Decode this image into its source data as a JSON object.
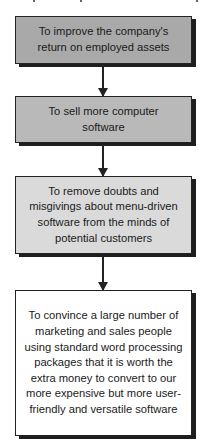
{
  "diagram": {
    "type": "flowchart",
    "direction": "top-to-bottom",
    "nodes": [
      {
        "id": "n1",
        "text": "To improve the company's return on employed assets",
        "fill": "#a9a9a9"
      },
      {
        "id": "n2",
        "text": "To sell more computer software",
        "fill": "#b9b9b9"
      },
      {
        "id": "n3",
        "text": "To remove doubts and misgivings about menu-driven software from the minds of potential customers",
        "fill": "#dadada"
      },
      {
        "id": "n4",
        "text": "To convince a large number of marketing and sales people using standard word processing packages that it is worth the extra money to convert to our more expensive but more user-friendly and versatile software",
        "fill": "#ffffff"
      }
    ],
    "edges": [
      {
        "from": "n1",
        "to": "n2"
      },
      {
        "from": "n2",
        "to": "n3"
      },
      {
        "from": "n3",
        "to": "n4"
      }
    ]
  }
}
